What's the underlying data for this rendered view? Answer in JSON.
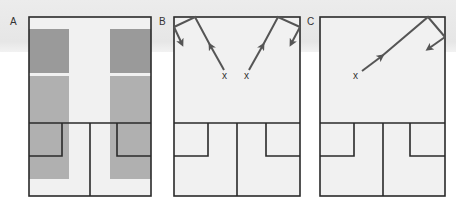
{
  "figure": {
    "panels": [
      {
        "label": "A",
        "marker": ""
      },
      {
        "label": "B",
        "markers": [
          "x",
          "x"
        ]
      },
      {
        "label": "C",
        "markers": [
          "x"
        ]
      }
    ]
  },
  "colors": {
    "panel_fill": "#f1f1f1",
    "outline": "#2a2a2a",
    "gray_dark": "#9a9a9a",
    "gray_light": "#b0b0b0",
    "arrow": "#555555",
    "band": "#e8e8e8"
  }
}
